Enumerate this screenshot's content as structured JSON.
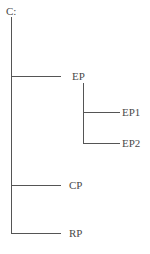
{
  "tree": {
    "root": {
      "label": "C:"
    },
    "nodes": [
      {
        "id": "EP",
        "label": "EP",
        "children": [
          {
            "id": "EP1",
            "label": "EP1"
          },
          {
            "id": "EP2",
            "label": "EP2"
          }
        ]
      },
      {
        "id": "CP",
        "label": "CP"
      },
      {
        "id": "RP",
        "label": "RP"
      }
    ]
  },
  "colors": {
    "line": "#555555",
    "text": "#4a4a4a",
    "background": "#ffffff"
  }
}
